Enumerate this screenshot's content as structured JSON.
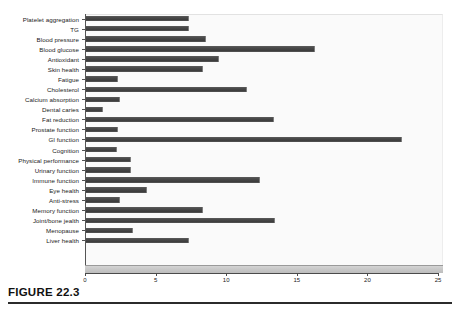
{
  "figure": {
    "caption": "FIGURE 22.3"
  },
  "chart_data": {
    "type": "bar",
    "orientation": "horizontal",
    "title": "",
    "xlabel": "",
    "ylabel": "",
    "xlim": [
      0,
      25
    ],
    "xticks": [
      "0",
      "5",
      "10",
      "15",
      "20",
      "25"
    ],
    "xtick_values": [
      0,
      5,
      10,
      15,
      20,
      25
    ],
    "grid": false,
    "legend": "none",
    "bar_color": "#4a4a4a",
    "plot_background": "#fafafa",
    "categories": [
      "Platelet aggregation",
      "TG",
      "Blood pressure",
      "Blood glucose",
      "Antioxidant",
      "Skin health",
      "Fatigue",
      "Cholesterol",
      "Calcium absorption",
      "Dental caries",
      "Fat reduction",
      "Prostate function",
      "GI function",
      "Cognition",
      "Physical performance",
      "Urinary function",
      "Immune function",
      "Eye health",
      "Anti-stress",
      "Memory function",
      "Joint/bone jealth",
      "Menopause",
      "Liver health"
    ],
    "values": [
      7.3,
      7.3,
      8.5,
      16.2,
      9.4,
      8.3,
      2.3,
      11.4,
      2.4,
      1.2,
      13.3,
      2.3,
      22.4,
      2.2,
      3.2,
      3.2,
      12.3,
      4.3,
      2.4,
      8.3,
      13.4,
      3.3,
      7.3
    ]
  }
}
